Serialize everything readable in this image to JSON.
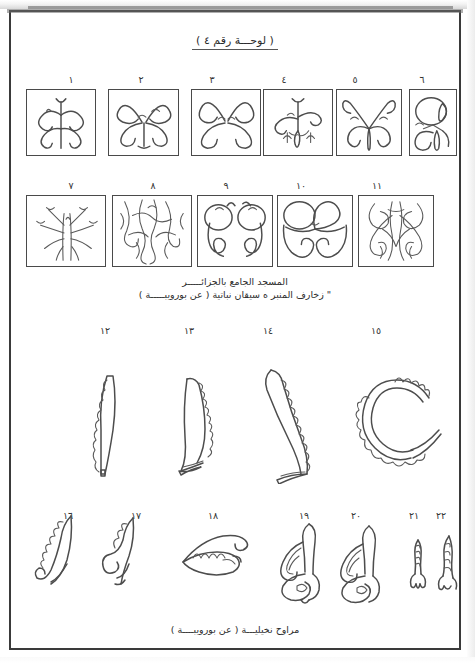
{
  "page": {
    "title": "( لوحـــة رقم ٤ )",
    "background_color": "#ffffff",
    "ink_color": "#4d4d4d",
    "frame_color": "#3a3a3a"
  },
  "plate": {
    "grid_rows": [
      {
        "row": 1,
        "cells": [
          {
            "number": "١",
            "motif": "split-palmette-scroll-pair"
          },
          {
            "number": "٢",
            "motif": "four-lobe-interlaced-scroll"
          },
          {
            "number": "٣",
            "motif": "double-volute-mirrored"
          },
          {
            "number": "٤",
            "motif": "central-bud-with-tendrils"
          },
          {
            "number": "٥",
            "motif": "arched-stems-with-lotus-bud"
          },
          {
            "number": "٦",
            "motif": "stacked-circles-narrow-panel"
          }
        ]
      },
      {
        "row": 2,
        "cells": [
          {
            "number": "٧",
            "motif": "fine-line-branching-stems"
          },
          {
            "number": "٨",
            "motif": "dense-interlace-foliage"
          },
          {
            "number": "٩",
            "motif": "twin-looped-drop-scrolls"
          },
          {
            "number": "١٠",
            "motif": "heart-shaped-mirrored-scrolls"
          },
          {
            "number": "١١",
            "motif": "complex-interlaced-palmettes"
          }
        ]
      }
    ],
    "caption_lines": [
      "المسجد الجامع بالجزائـــــر",
      "\" زخارف المنبر ﻩ سيقان نباتية   ( عن بورويبـــــة )"
    ]
  },
  "leaf_row": {
    "items": [
      {
        "number": "١٢",
        "motif": "straight-serrated-palm-leaf"
      },
      {
        "number": "١٣",
        "motif": "curved-serrated-palm-leaf"
      },
      {
        "number": "١٤",
        "motif": "s-curve-serrated-palm-leaf"
      },
      {
        "number": "١٥",
        "motif": "coiled-circular-palm-fan"
      }
    ]
  },
  "small_row": {
    "items": [
      {
        "number": "١٦",
        "motif": "spiral-tipped-fan-leaf"
      },
      {
        "number": "١٧",
        "motif": "volute-scroll-fan-leaf"
      },
      {
        "number": "١٨",
        "motif": "horizontal-winged-leaf"
      },
      {
        "number": "١٩",
        "motif": "upright-winged-palmette"
      },
      {
        "number": "٢٠",
        "motif": "upright-winged-palmette-variant"
      },
      {
        "number": "٢١",
        "motif": "small-narrow-palmette"
      },
      {
        "number": "٢٢",
        "motif": "small-narrow-palmette-variant"
      }
    ],
    "caption": "مراوح نخيليـــة ( عن بورويبــــة )"
  }
}
